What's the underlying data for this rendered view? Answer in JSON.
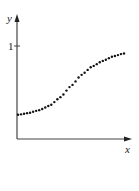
{
  "chart_data": {
    "type": "scatter",
    "title": "",
    "xlabel": "x",
    "ylabel": "y",
    "yticks": [
      "1"
    ],
    "grid": false,
    "legend": null,
    "x": [
      0.0,
      0.1,
      0.2,
      0.3,
      0.4,
      0.5,
      0.6,
      0.7,
      0.8,
      0.9,
      1.0
    ],
    "y": [
      0.26,
      0.28,
      0.31,
      0.36,
      0.45,
      0.57,
      0.69,
      0.78,
      0.84,
      0.89,
      0.92
    ],
    "ylim": [
      0,
      1.3
    ],
    "xlim": [
      0,
      1.1
    ]
  },
  "labels": {
    "x_axis": "x",
    "y_axis": "y",
    "y_tick_1": "1"
  }
}
